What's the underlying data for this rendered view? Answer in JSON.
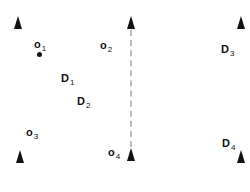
{
  "diagram": {
    "colors": {
      "marker": "#111111",
      "divider": "#bbbbbb",
      "background": "#ffffff"
    },
    "triangles": [
      {
        "id": "tri-top-left",
        "x": 14,
        "y": 16
      },
      {
        "id": "tri-top-center",
        "x": 127,
        "y": 16
      },
      {
        "id": "tri-top-right",
        "x": 237,
        "y": 16
      },
      {
        "id": "tri-bottom-left",
        "x": 16,
        "y": 150
      },
      {
        "id": "tri-bottom-center",
        "x": 127,
        "y": 148
      },
      {
        "id": "tri-bottom-right",
        "x": 237,
        "y": 150
      }
    ],
    "labels": {
      "o1": {
        "base": "o",
        "sub": "1"
      },
      "o2": {
        "base": "o",
        "sub": "2"
      },
      "o3": {
        "base": "o",
        "sub": "3"
      },
      "o4": {
        "base": "o",
        "sub": "4"
      },
      "d1": {
        "base": "D",
        "sub": "1"
      },
      "d2": {
        "base": "D",
        "sub": "2"
      },
      "d3": {
        "base": "D",
        "sub": "3"
      },
      "d4": {
        "base": "D",
        "sub": "4"
      }
    },
    "dot": {
      "x": 38,
      "y": 53
    },
    "divider": {
      "x": 130,
      "y_start": 30,
      "y_end": 147,
      "style": "dashed"
    }
  }
}
